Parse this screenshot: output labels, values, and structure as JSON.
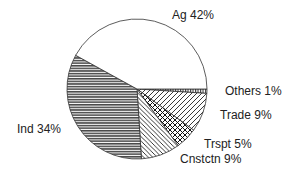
{
  "chart_data": {
    "type": "pie",
    "title": "",
    "start": "3 o'clock",
    "direction": "clockwise",
    "slices": [
      {
        "name": "Others",
        "label": "Others 1%",
        "value": 1,
        "pattern": "vertical-lines"
      },
      {
        "name": "Trade",
        "label": "Trade 9%",
        "value": 9,
        "pattern": "diagonal-up"
      },
      {
        "name": "Trspt",
        "label": "Trspt 5%",
        "value": 5,
        "pattern": "crosshatch"
      },
      {
        "name": "Cnstctn",
        "label": "Cnstctn 9%",
        "value": 9,
        "pattern": "diagonal-down"
      },
      {
        "name": "Ind",
        "label": "Ind 34%",
        "value": 34,
        "pattern": "horizontal-lines"
      },
      {
        "name": "Ag",
        "label": "Ag 42%",
        "value": 42,
        "pattern": "none"
      }
    ],
    "colors": {
      "stroke": "#333333",
      "fill": "#ffffff",
      "text": "#222222"
    }
  }
}
